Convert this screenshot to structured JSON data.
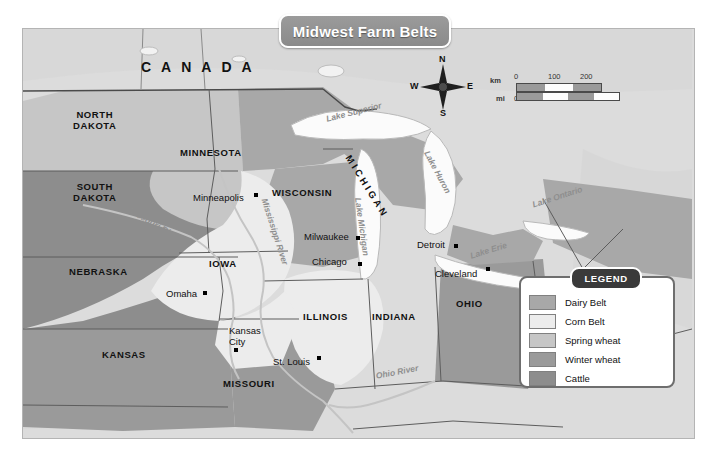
{
  "map": {
    "title": "Midwest Farm Belts",
    "background_color": "#dcdcdc",
    "frame_color": "#b4b4b4"
  },
  "country_labels": [
    {
      "name": "CANADA",
      "text": "CANADA",
      "x": 140,
      "y": 58
    }
  ],
  "state_labels": [
    {
      "name": "north-dakota",
      "text": "NORTH\nDAKOTA",
      "x": 72,
      "y": 108
    },
    {
      "name": "south-dakota",
      "text": "SOUTH\nDAKOTA",
      "x": 72,
      "y": 180
    },
    {
      "name": "nebraska",
      "text": "NEBRASKA",
      "x": 68,
      "y": 265
    },
    {
      "name": "kansas",
      "text": "KANSAS",
      "x": 101,
      "y": 348
    },
    {
      "name": "minnesota",
      "text": "MINNESOTA",
      "x": 179,
      "y": 146
    },
    {
      "name": "iowa",
      "text": "IOWA",
      "x": 208,
      "y": 257
    },
    {
      "name": "missouri",
      "text": "MISSOURI",
      "x": 222,
      "y": 377
    },
    {
      "name": "wisconsin",
      "text": "WISCONSIN",
      "x": 271,
      "y": 186
    },
    {
      "name": "illinois",
      "text": "ILLINOIS",
      "x": 302,
      "y": 310
    },
    {
      "name": "indiana",
      "text": "INDIANA",
      "x": 371,
      "y": 310
    },
    {
      "name": "ohio",
      "text": "OHIO",
      "x": 455,
      "y": 297
    },
    {
      "name": "michigan",
      "text": "MICHIGAN",
      "x": 352,
      "y": 152
    }
  ],
  "city_labels": [
    {
      "name": "minneapolis",
      "text": "Minneapolis",
      "x": 192,
      "y": 192,
      "dot_x": 253,
      "dot_y": 192
    },
    {
      "name": "milwaukee",
      "text": "Milwaukee",
      "x": 303,
      "y": 231,
      "dot_x": 355,
      "dot_y": 235
    },
    {
      "name": "chicago",
      "text": "Chicago",
      "x": 311,
      "y": 256,
      "dot_x": 357,
      "dot_y": 261
    },
    {
      "name": "detroit",
      "text": "Detroit",
      "x": 416,
      "y": 239,
      "dot_x": 453,
      "dot_y": 243
    },
    {
      "name": "cleveland",
      "text": "Cleveland",
      "x": 434,
      "y": 268,
      "dot_x": 485,
      "dot_y": 266
    },
    {
      "name": "omaha",
      "text": "Omaha",
      "x": 165,
      "y": 288,
      "dot_x": 202,
      "dot_y": 290
    },
    {
      "name": "kansas-city",
      "text": "Kansas\nCity",
      "x": 228,
      "y": 325,
      "dot_x": 233,
      "dot_y": 347
    },
    {
      "name": "st-louis",
      "text": "St. Louis",
      "x": 272,
      "y": 356,
      "dot_x": 316,
      "dot_y": 355
    }
  ],
  "water_labels": [
    {
      "name": "lake-superior",
      "text": "Lake Superior",
      "x": 324,
      "y": 113,
      "rotate": -14
    },
    {
      "name": "lake-michigan",
      "text": "Lake Michigan",
      "x": 362,
      "y": 196,
      "rotate": 82
    },
    {
      "name": "lake-huron",
      "text": "Lake Huron",
      "x": 430,
      "y": 148,
      "rotate": 62
    },
    {
      "name": "lake-erie",
      "text": "Lake Erie",
      "x": 468,
      "y": 250,
      "rotate": -17
    },
    {
      "name": "lake-ontario",
      "text": "Lake Ontario",
      "x": 530,
      "y": 199,
      "rotate": -18
    }
  ],
  "river_labels": [
    {
      "name": "missouri-river",
      "text": "Missouri River",
      "x": 131,
      "y": 204,
      "rotate": 30
    },
    {
      "name": "mississippi-river",
      "text": "Mississippi River",
      "x": 268,
      "y": 196,
      "rotate": 72
    },
    {
      "name": "ohio-river",
      "text": "Ohio River",
      "x": 374,
      "y": 370,
      "rotate": -11
    }
  ],
  "compass": {
    "name": "compass-rose",
    "north": "N",
    "east": "E",
    "south": "S",
    "west": "W"
  },
  "scalebar": {
    "km_unit": "km",
    "mi_unit": "mi",
    "km_ticks": [
      "0",
      "100",
      "200"
    ],
    "mi_ticks": [
      "0",
      "100",
      "200"
    ]
  },
  "legend": {
    "title": "LEGEND",
    "items": [
      {
        "label": "Dairy Belt",
        "color": "#a8a8a8"
      },
      {
        "label": "Corn Belt",
        "color": "#ececec"
      },
      {
        "label": "Spring wheat",
        "color": "#c6c6c6"
      },
      {
        "label": "Winter wheat",
        "color": "#9a9a9a"
      },
      {
        "label": "Cattle",
        "color": "#8d8d8d"
      }
    ]
  }
}
